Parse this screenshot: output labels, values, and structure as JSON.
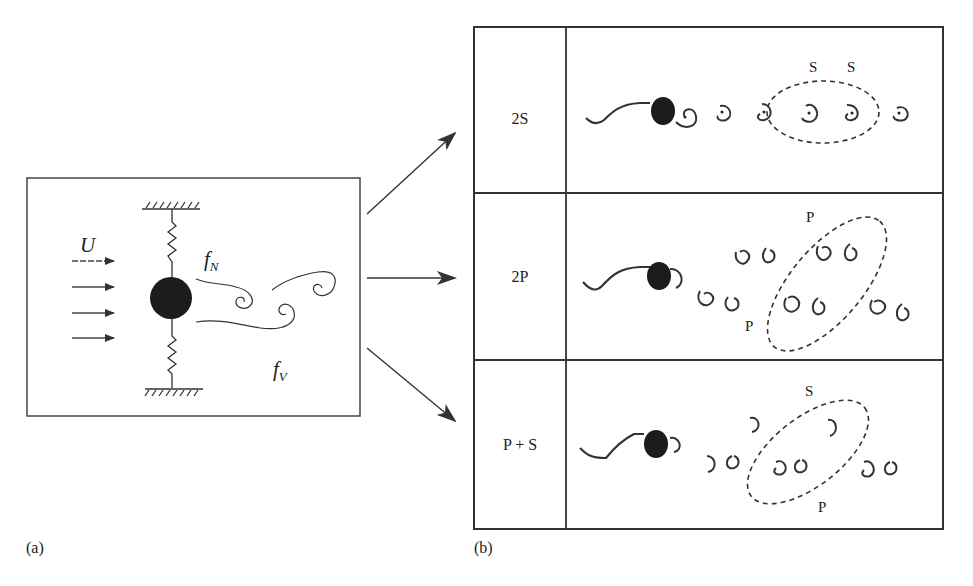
{
  "figure": {
    "panel_a": {
      "label": "(a)",
      "flow_symbol": "U",
      "natural_frequency": {
        "base": "f",
        "sub": "N"
      },
      "vortex_frequency": {
        "base": "f",
        "sub": "V"
      },
      "flow_arrow_count": 4
    },
    "panel_b": {
      "label": "(b)",
      "rows": [
        {
          "mode": "2S",
          "annotations": [
            "S",
            "S"
          ]
        },
        {
          "mode": "2P",
          "annotations": [
            "P",
            "P"
          ]
        },
        {
          "mode": "P + S",
          "annotations": [
            "S",
            "P"
          ]
        }
      ]
    },
    "connector_arrows": 3
  }
}
